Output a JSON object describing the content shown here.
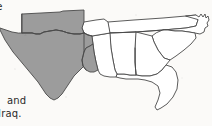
{
  "page": {
    "width": 212,
    "height": 126,
    "background_color": "#fbfaf8"
  },
  "text_fragments": {
    "top_clipped": "e",
    "line_and": "and",
    "line_iraq": "Iraq."
  },
  "map": {
    "title": "",
    "region": "south-central and southeastern United States",
    "shaded_fill_color": "#9c9c9c",
    "unshaded_fill_color": "#ffffff",
    "outline_color": "#4a4a4a",
    "states": [
      {
        "id": "texas",
        "label": "Texas",
        "shaded": true
      },
      {
        "id": "oklahoma",
        "label": "Oklahoma",
        "shaded": true
      },
      {
        "id": "louisiana",
        "label": "Louisiana",
        "shaded": true
      },
      {
        "id": "arkansas",
        "label": "Arkansas",
        "shaded": false
      },
      {
        "id": "mississippi",
        "label": "Mississippi",
        "shaded": false
      },
      {
        "id": "alabama",
        "label": "Alabama",
        "shaded": false
      },
      {
        "id": "georgia",
        "label": "Georgia",
        "shaded": false
      },
      {
        "id": "florida",
        "label": "Florida",
        "shaded": false
      },
      {
        "id": "tennessee",
        "label": "Tennessee",
        "shaded": false
      },
      {
        "id": "north-carolina",
        "label": "North Carolina",
        "shaded": false
      },
      {
        "id": "south-carolina",
        "label": "South Carolina",
        "shaded": false
      }
    ]
  }
}
